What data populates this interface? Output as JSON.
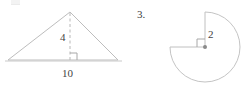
{
  "page": {
    "background_color": "#ffffff",
    "width": 247,
    "height": 91
  },
  "figures": [
    {
      "id": "triangle-figure",
      "shape": "triangle",
      "description": "Triangle with dashed altitude drawn from apex to base, right-angle marker at the foot of the altitude",
      "stroke_color": "#bdbdbd",
      "labels": {
        "height": "4",
        "base": "10"
      },
      "geometry": {
        "apex": [
          70,
          12
        ],
        "left_vertex": [
          8,
          60
        ],
        "right_vertex": [
          118,
          60
        ],
        "baseline_left": [
          5,
          61
        ],
        "baseline_right": [
          122,
          61
        ],
        "altitude_foot": [
          70,
          60
        ],
        "right_angle_marker_size": 7
      }
    },
    {
      "id": "sector-figure",
      "shape": "three-quarter-circle",
      "description": "Circle with a quarter removed from the upper-left quadrant, radii drawn up and to the left from the center, right-angle marker at the center",
      "stroke_color": "#c4c4c4",
      "problem_number": "3.",
      "labels": {
        "radius": "2"
      },
      "geometry": {
        "center": [
          205,
          47
        ],
        "radius": 35,
        "arc_start_angle_deg": 270,
        "arc_sweep_deg": 270,
        "radius_line_up_end": [
          205,
          12
        ],
        "radius_line_left_end": [
          170,
          47
        ],
        "center_dot_radius": 2,
        "right_angle_marker_size": 8
      }
    }
  ],
  "icons": {
    "right_angle_marker": "right-angle-icon",
    "center_point": "center-dot-icon"
  },
  "colors": {
    "line": "#bdbdbd",
    "line_sector": "#c4c4c4",
    "dashed_line": "#b8b8b8",
    "text": "#3d3d3d",
    "center_dot": "#8a8a8a",
    "background": "#ffffff"
  }
}
